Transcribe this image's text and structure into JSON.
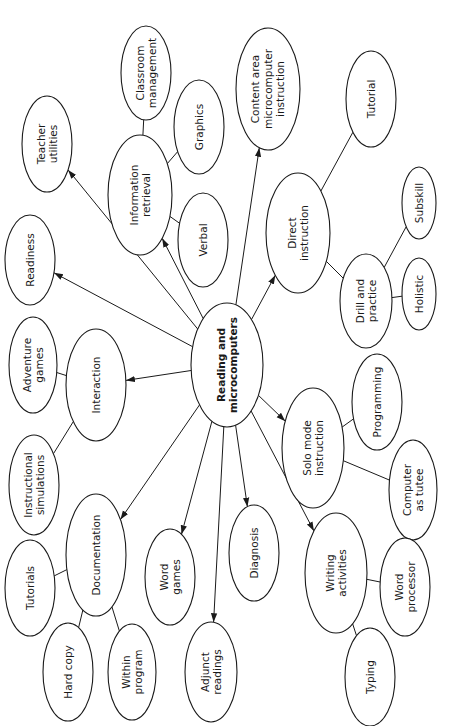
{
  "diagram": {
    "orientation": "rotated-90-ccw",
    "colors": {
      "stroke": "#1a1a1a",
      "fill": "#ffffff",
      "text": "#1a1a1a"
    },
    "nodes": [
      {
        "id": "center",
        "lines": [
          "Reading and",
          "microcomputers"
        ],
        "bold": true
      },
      {
        "id": "teacher-utilities",
        "lines": [
          "Teacher",
          "utilities"
        ]
      },
      {
        "id": "readiness",
        "lines": [
          "Readiness"
        ]
      },
      {
        "id": "information-retrieval",
        "lines": [
          "Information",
          "retrieval"
        ]
      },
      {
        "id": "classroom-management",
        "lines": [
          "Classroom",
          "management"
        ]
      },
      {
        "id": "graphics",
        "lines": [
          "Graphics"
        ]
      },
      {
        "id": "verbal",
        "lines": [
          "Verbal"
        ]
      },
      {
        "id": "content-area",
        "lines": [
          "Content area",
          "microcomputer",
          "instruction"
        ]
      },
      {
        "id": "tutorial",
        "lines": [
          "Tutorial"
        ]
      },
      {
        "id": "direct-instruction",
        "lines": [
          "Direct",
          "instruction"
        ]
      },
      {
        "id": "drill-and-practice",
        "lines": [
          "Drill and",
          "practice"
        ]
      },
      {
        "id": "subskill",
        "lines": [
          "Subskill"
        ]
      },
      {
        "id": "holistic",
        "lines": [
          "Holistic"
        ]
      },
      {
        "id": "adventure-games",
        "lines": [
          "Adventure",
          "games"
        ]
      },
      {
        "id": "interaction",
        "lines": [
          "Interaction"
        ]
      },
      {
        "id": "instructional-simulations",
        "lines": [
          "Instructional",
          "simulations"
        ]
      },
      {
        "id": "solo-mode-instruction",
        "lines": [
          "Solo mode",
          "instruction"
        ]
      },
      {
        "id": "programming",
        "lines": [
          "Programming"
        ]
      },
      {
        "id": "computer-as-tutee",
        "lines": [
          "Computer",
          "as tutee"
        ]
      },
      {
        "id": "tutorials",
        "lines": [
          "Tutorials"
        ]
      },
      {
        "id": "documentation",
        "lines": [
          "Documentation"
        ]
      },
      {
        "id": "hard-copy",
        "lines": [
          "Hard copy"
        ]
      },
      {
        "id": "within-program",
        "lines": [
          "Within",
          "program"
        ]
      },
      {
        "id": "word-games",
        "lines": [
          "Word",
          "games"
        ]
      },
      {
        "id": "adjunct-readings",
        "lines": [
          "Adjunct",
          "readings"
        ]
      },
      {
        "id": "diagnosis",
        "lines": [
          "Diagnosis"
        ]
      },
      {
        "id": "writing-activities",
        "lines": [
          "Writing",
          "activities"
        ]
      },
      {
        "id": "word-processor",
        "lines": [
          "Word",
          "processor"
        ]
      },
      {
        "id": "typing",
        "lines": [
          "Typing"
        ]
      }
    ],
    "edges": [
      {
        "from": "center",
        "to": "teacher-utilities",
        "arrow": true
      },
      {
        "from": "center",
        "to": "readiness",
        "arrow": true
      },
      {
        "from": "center",
        "to": "information-retrieval",
        "arrow": true
      },
      {
        "from": "center",
        "to": "content-area",
        "arrow": true
      },
      {
        "from": "center",
        "to": "direct-instruction",
        "arrow": true
      },
      {
        "from": "center",
        "to": "interaction",
        "arrow": true
      },
      {
        "from": "center",
        "to": "solo-mode-instruction",
        "arrow": true
      },
      {
        "from": "center",
        "to": "documentation",
        "arrow": true
      },
      {
        "from": "center",
        "to": "word-games",
        "arrow": true
      },
      {
        "from": "center",
        "to": "adjunct-readings",
        "arrow": true
      },
      {
        "from": "center",
        "to": "diagnosis",
        "arrow": true
      },
      {
        "from": "center",
        "to": "writing-activities",
        "arrow": true
      },
      {
        "from": "information-retrieval",
        "to": "classroom-management",
        "arrow": false
      },
      {
        "from": "information-retrieval",
        "to": "graphics",
        "arrow": false
      },
      {
        "from": "information-retrieval",
        "to": "verbal",
        "arrow": false
      },
      {
        "from": "direct-instruction",
        "to": "tutorial",
        "arrow": false
      },
      {
        "from": "direct-instruction",
        "to": "drill-and-practice",
        "arrow": false
      },
      {
        "from": "drill-and-practice",
        "to": "subskill",
        "arrow": false
      },
      {
        "from": "drill-and-practice",
        "to": "holistic",
        "arrow": false
      },
      {
        "from": "interaction",
        "to": "adventure-games",
        "arrow": false
      },
      {
        "from": "interaction",
        "to": "instructional-simulations",
        "arrow": false
      },
      {
        "from": "solo-mode-instruction",
        "to": "programming",
        "arrow": false
      },
      {
        "from": "solo-mode-instruction",
        "to": "computer-as-tutee",
        "arrow": false
      },
      {
        "from": "documentation",
        "to": "tutorials",
        "arrow": false
      },
      {
        "from": "documentation",
        "to": "hard-copy",
        "arrow": false
      },
      {
        "from": "documentation",
        "to": "within-program",
        "arrow": false
      },
      {
        "from": "writing-activities",
        "to": "word-processor",
        "arrow": false
      },
      {
        "from": "writing-activities",
        "to": "typing",
        "arrow": false
      }
    ]
  }
}
